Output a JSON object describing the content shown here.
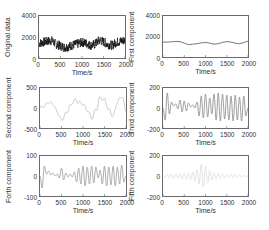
{
  "chart_data": [
    {
      "type": "line",
      "title": "",
      "xlabel": "Time/s",
      "ylabel": "Original data",
      "xlim": [
        0,
        2000
      ],
      "ylim": [
        0,
        4000
      ],
      "xticks": [
        "0",
        "500",
        "1000",
        "1500",
        "2000"
      ],
      "yticks": [
        "4000",
        "2000",
        "0"
      ],
      "color": "#111111",
      "grid": false,
      "description": "Noisy signal fluctuating around ~1400 with range ~800-2200",
      "x": [
        0,
        100,
        200,
        300,
        400,
        500,
        600,
        700,
        800,
        900,
        1000,
        1100,
        1200,
        1300,
        1400,
        1500,
        1600,
        1700,
        1800,
        1900,
        2000
      ],
      "values": [
        1400,
        1500,
        1600,
        1650,
        1300,
        1150,
        1000,
        1100,
        1250,
        1350,
        1500,
        1400,
        1200,
        1300,
        1700,
        1550,
        1300,
        1200,
        1500,
        1600,
        1700
      ]
    },
    {
      "type": "line",
      "title": "",
      "xlabel": "Time/s",
      "ylabel": "First component",
      "xlim": [
        0,
        2000
      ],
      "ylim": [
        0,
        4000
      ],
      "xticks": [
        "0",
        "500",
        "1000",
        "1500",
        "2000"
      ],
      "yticks": [
        "4000",
        "2000",
        "0"
      ],
      "color": "#555555",
      "grid": false,
      "description": "Smooth low-frequency trend around 1400",
      "x": [
        0,
        100,
        200,
        300,
        400,
        500,
        600,
        700,
        800,
        900,
        1000,
        1100,
        1200,
        1300,
        1400,
        1500,
        1600,
        1700,
        1800,
        1900,
        2000
      ],
      "values": [
        1450,
        1450,
        1480,
        1520,
        1500,
        1350,
        1200,
        1250,
        1300,
        1380,
        1420,
        1350,
        1250,
        1300,
        1420,
        1500,
        1450,
        1350,
        1300,
        1400,
        1550
      ]
    },
    {
      "type": "line",
      "title": "",
      "xlabel": "Time/s",
      "ylabel": "Second component",
      "xlim": [
        0,
        2000
      ],
      "ylim": [
        -500,
        500
      ],
      "xticks": [
        "0",
        "500",
        "1000",
        "1500",
        "2000"
      ],
      "yticks": [
        "500",
        "0",
        "-500"
      ],
      "color": "#bbbbbb",
      "grid": false,
      "x": [
        0,
        100,
        200,
        300,
        400,
        500,
        600,
        700,
        800,
        900,
        1000,
        1100,
        1200,
        1300,
        1400,
        1500,
        1600,
        1700,
        1800,
        1900,
        2000
      ],
      "values": [
        0,
        50,
        150,
        100,
        -100,
        -300,
        -150,
        50,
        200,
        150,
        100,
        -50,
        -250,
        -50,
        250,
        200,
        -50,
        -200,
        150,
        300,
        -50
      ]
    },
    {
      "type": "line",
      "title": "",
      "xlabel": "Time/s",
      "ylabel": "Third component",
      "xlim": [
        0,
        2000
      ],
      "ylim": [
        -200,
        200
      ],
      "xticks": [
        "0",
        "500",
        "1000",
        "1500",
        "2000"
      ],
      "yticks": [
        "200",
        "0",
        "-200"
      ],
      "color": "#888888",
      "grid": false,
      "x": [
        0,
        50,
        100,
        150,
        200,
        250,
        300,
        350,
        400,
        450,
        500,
        550,
        600,
        650,
        700,
        750,
        800,
        850,
        900,
        950,
        1000,
        1050,
        1100,
        1150,
        1200,
        1250,
        1300,
        1350,
        1400,
        1450,
        1500,
        1550,
        1600,
        1650,
        1700,
        1750,
        1800,
        1850,
        1900,
        1950,
        2000
      ],
      "values": [
        0,
        -120,
        150,
        -60,
        60,
        20,
        40,
        -10,
        80,
        -40,
        70,
        -30,
        50,
        10,
        30,
        0,
        60,
        -80,
        120,
        -100,
        140,
        -90,
        100,
        -60,
        140,
        -120,
        150,
        -130,
        140,
        -110,
        130,
        -120,
        120,
        -130,
        130,
        -120,
        110,
        -130,
        120,
        -80,
        0
      ]
    },
    {
      "type": "line",
      "title": "",
      "xlabel": "Time/s",
      "ylabel": "Forth component",
      "xlim": [
        0,
        2000
      ],
      "ylim": [
        -100,
        100
      ],
      "xticks": [
        "0",
        "500",
        "1000",
        "1500",
        "2000"
      ],
      "yticks": [
        "100",
        "0",
        "-100"
      ],
      "color": "#999999",
      "grid": false,
      "x": [
        0,
        50,
        100,
        150,
        200,
        250,
        300,
        350,
        400,
        450,
        500,
        550,
        600,
        650,
        700,
        750,
        800,
        850,
        900,
        950,
        1000,
        1050,
        1100,
        1150,
        1200,
        1250,
        1300,
        1350,
        1400,
        1450,
        1500,
        1550,
        1600,
        1650,
        1700,
        1750,
        1800,
        1850,
        1900,
        1950,
        2000
      ],
      "values": [
        0,
        -60,
        50,
        10,
        25,
        5,
        15,
        0,
        10,
        -10,
        40,
        -20,
        15,
        -5,
        10,
        -5,
        20,
        -30,
        40,
        -40,
        50,
        -50,
        45,
        -40,
        50,
        -35,
        45,
        -10,
        30,
        -40,
        50,
        -50,
        45,
        -45,
        50,
        -50,
        45,
        -40,
        55,
        -30,
        0
      ]
    },
    {
      "type": "line",
      "title": "",
      "xlabel": "Time/s",
      "ylabel": "Fifth component",
      "xlim": [
        0,
        2000
      ],
      "ylim": [
        -200,
        200
      ],
      "xticks": [
        "0",
        "500",
        "1000",
        "1500",
        "2000"
      ],
      "yticks": [
        "200",
        "0",
        "-200"
      ],
      "color": "#dddddd",
      "grid": false,
      "x": [
        0,
        50,
        100,
        150,
        200,
        250,
        300,
        350,
        400,
        450,
        500,
        550,
        600,
        650,
        700,
        750,
        800,
        850,
        900,
        950,
        1000,
        1050,
        1100,
        1150,
        1200,
        1250,
        1300,
        1350,
        1400,
        1450,
        1500,
        1550,
        1600,
        1650,
        1700,
        1750,
        1800,
        1850,
        1900,
        1950,
        2000
      ],
      "values": [
        0,
        -10,
        15,
        -20,
        20,
        -25,
        20,
        -20,
        25,
        -30,
        30,
        -35,
        30,
        -40,
        40,
        -50,
        60,
        -80,
        120,
        -110,
        100,
        -70,
        50,
        -40,
        30,
        -30,
        25,
        -25,
        20,
        -20,
        15,
        -15,
        20,
        -20,
        15,
        -10,
        10,
        -10,
        8,
        -5,
        0
      ]
    }
  ]
}
